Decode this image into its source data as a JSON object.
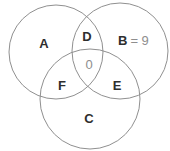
{
  "venn": {
    "labels": {
      "a": "A",
      "b": "B",
      "b_value": "= 9",
      "c": "C",
      "d": "D",
      "e": "E",
      "f": "F",
      "center_value": "0"
    },
    "colors": {
      "background": "#ffffff",
      "circle_stroke": "#909090",
      "label_text": "#2e2e2e",
      "value_text": "#8e8e8e"
    }
  }
}
